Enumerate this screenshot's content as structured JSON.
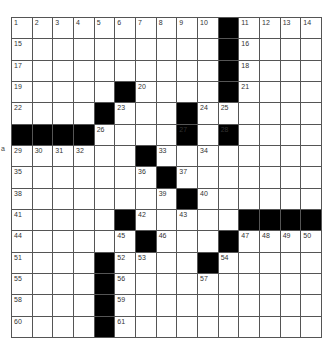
{
  "puzzle": {
    "rows": 15,
    "cols": 15,
    "side_mark": "a",
    "layout": [
      "..........#....",
      "..........#....",
      "..........#....",
      ".....#....#....",
      "....#...#......",
      "####....#.#....",
      "......#........",
      ".......#.......",
      "........#......",
      ".....#.....####",
      "......#...#....",
      "....#....#.....",
      "....#..........",
      "....#..........",
      "....#.........."
    ],
    "numbers": {
      "0,0": "1",
      "0,1": "2",
      "0,2": "3",
      "0,3": "4",
      "0,4": "5",
      "0,5": "6",
      "0,6": "7",
      "0,7": "8",
      "0,8": "9",
      "0,9": "10",
      "0,11": "11",
      "0,12": "12",
      "0,13": "13",
      "0,14": "14",
      "1,0": "15",
      "1,11": "16",
      "2,0": "17",
      "2,11": "18",
      "3,0": "19",
      "3,6": "20",
      "3,11": "21",
      "4,0": "22",
      "4,5": "23",
      "4,9": "24",
      "4,10": "25",
      "5,4": "26",
      "5,8": "27",
      "5,10": "28",
      "6,0": "29",
      "6,1": "30",
      "6,2": "31",
      "6,3": "32",
      "6,7": "33",
      "6,9": "34",
      "7,0": "35",
      "7,6": "36",
      "7,8": "37",
      "8,0": "38",
      "8,7": "39",
      "8,9": "40",
      "9,0": "41",
      "9,6": "42",
      "9,8": "43",
      "10,0": "44",
      "10,5": "45",
      "10,7": "46",
      "10,11": "47",
      "10,12": "48",
      "10,13": "49",
      "10,14": "50",
      "11,0": "51",
      "11,5": "52",
      "11,6": "53",
      "11,10": "54",
      "12,0": "55",
      "12,5": "56",
      "12,9": "57",
      "13,0": "58",
      "13,5": "59",
      "14,0": "60",
      "14,5": "61"
    },
    "colors": {
      "block": "#000000",
      "cell": "#ffffff",
      "line": "#555555"
    }
  }
}
